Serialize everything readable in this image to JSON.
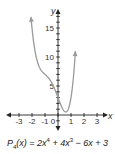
{
  "chart_data": {
    "type": "line",
    "title": "",
    "xlabel": "x",
    "ylabel": "y",
    "xlim": [
      -3.5,
      3.5
    ],
    "ylim": [
      -2,
      18
    ],
    "xticks": [
      -3,
      -2,
      -1,
      0,
      1,
      2,
      3
    ],
    "yticks_labeled": [
      5,
      10,
      15
    ],
    "ytick_step": 1,
    "grid": false,
    "series": [
      {
        "name": "P4(x) = 2x^4 + 4x^3 - 6x + 3",
        "color": "#999999",
        "x": [
          -2.1,
          -2.0,
          -1.75,
          -1.5,
          -1.25,
          -1.0,
          -0.75,
          -0.5,
          -0.25,
          0.0,
          0.25,
          0.5,
          0.75,
          1.0,
          1.25,
          1.4
        ],
        "y": [
          17.9,
          15.0,
          9.6,
          6.4,
          5.0,
          4.0,
          4.48,
          4.63,
          4.45,
          3.0,
          1.57,
          0.625,
          1.26,
          3.0,
          7.0,
          10.9
        ]
      }
    ],
    "arrows_on_ends": true
  },
  "caption": {
    "fn": "P",
    "sub": "4",
    "arg": "(x) = 2x",
    "exp1": "4",
    "mid": " + 4x",
    "exp2": "3",
    "tail": " − 6x + 3"
  },
  "axes": {
    "x_label": "x",
    "y_label": "y",
    "x_tick_labels": [
      "-3",
      "-2",
      "-1",
      "0",
      "1",
      "2",
      "3"
    ],
    "y_tick_labels": [
      "5",
      "10",
      "15"
    ]
  }
}
